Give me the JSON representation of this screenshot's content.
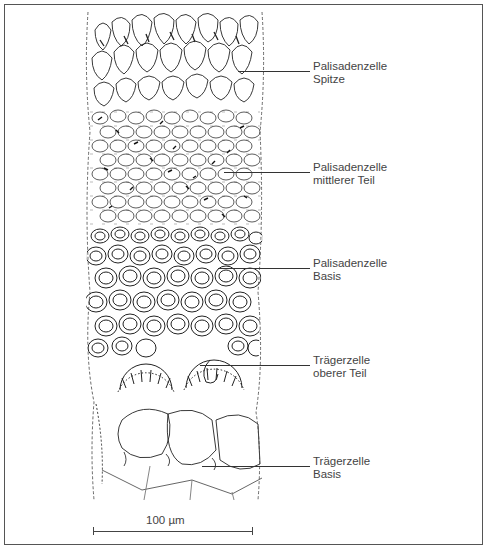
{
  "figure": {
    "labels": [
      {
        "line1": "Palisadenzelle",
        "line2": "Spitze",
        "leader_y": 71,
        "leader_x1": 238,
        "top": 60
      },
      {
        "line1": "Palisadenzelle",
        "line2": "mittlerer Teil",
        "leader_y": 172,
        "leader_x1": 224,
        "top": 161
      },
      {
        "line1": "Palisadenzelle",
        "line2": "Basis",
        "leader_y": 268,
        "leader_x1": 218,
        "top": 257
      },
      {
        "line1": "Trägerzelle",
        "line2": "oberer Teil",
        "leader_y": 365,
        "leader_x1": 200,
        "top": 354
      },
      {
        "line1": "Trägerzelle",
        "line2": "Basis",
        "leader_y": 466,
        "leader_x1": 202,
        "top": 455
      }
    ],
    "scale_bar": {
      "label": "100 µm",
      "x1": 93,
      "x2": 253,
      "y": 531
    }
  }
}
